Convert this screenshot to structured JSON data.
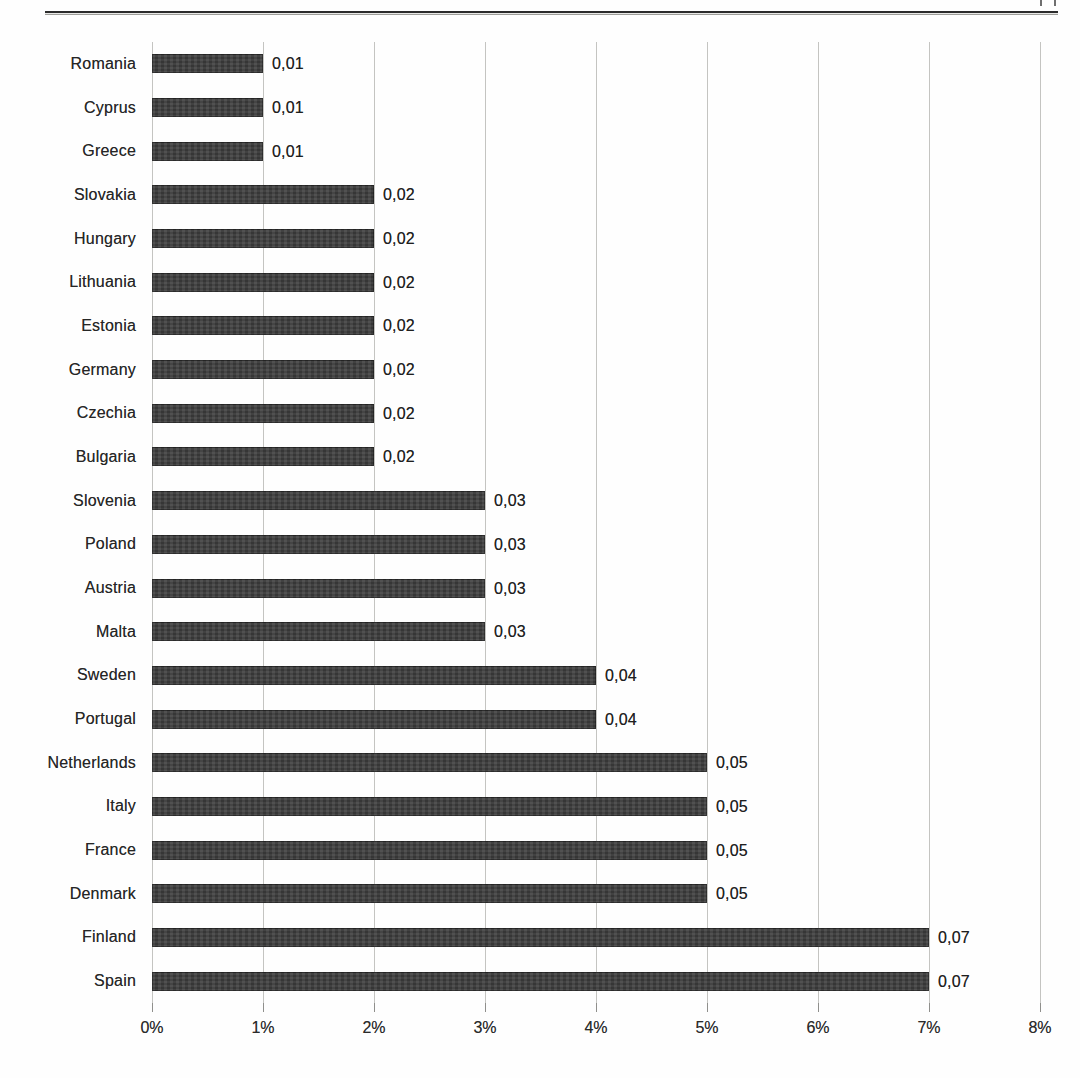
{
  "chart_data": {
    "type": "bar",
    "orientation": "horizontal",
    "title": "",
    "xlabel": "",
    "ylabel": "",
    "xlim": [
      0,
      0.08
    ],
    "grid": "vertical",
    "legend": "none",
    "bar_color": "#3d3d3d",
    "gridline_color": "#c4c4c1",
    "text_color": "#262626",
    "categories": [
      "Romania",
      "Cyprus",
      "Greece",
      "Slovakia",
      "Hungary",
      "Lithuania",
      "Estonia",
      "Germany",
      "Czechia",
      "Bulgaria",
      "Slovenia",
      "Poland",
      "Austria",
      "Malta",
      "Sweden",
      "Portugal",
      "Netherlands",
      "Italy",
      "France",
      "Denmark",
      "Finland",
      "Spain"
    ],
    "values": [
      0.01,
      0.01,
      0.01,
      0.02,
      0.02,
      0.02,
      0.02,
      0.02,
      0.02,
      0.02,
      0.03,
      0.03,
      0.03,
      0.03,
      0.04,
      0.04,
      0.05,
      0.05,
      0.05,
      0.05,
      0.07,
      0.07
    ],
    "value_labels": [
      "0,01",
      "0,01",
      "0,01",
      "0,02",
      "0,02",
      "0,02",
      "0,02",
      "0,02",
      "0,02",
      "0,02",
      "0,03",
      "0,03",
      "0,03",
      "0,03",
      "0,04",
      "0,04",
      "0,05",
      "0,05",
      "0,05",
      "0,05",
      "0,07",
      "0,07"
    ],
    "x_tick_labels": [
      "0%",
      "1%",
      "2%",
      "3%",
      "4%",
      "5%",
      "6%",
      "7%",
      "8%"
    ]
  }
}
